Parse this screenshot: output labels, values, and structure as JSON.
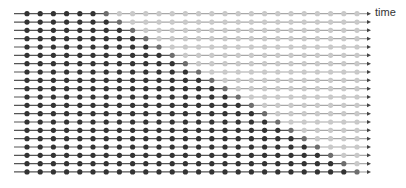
{
  "diagram": {
    "type": "timeline-staircase",
    "axis_label": "time",
    "rows": 20,
    "columns": 26,
    "layout": {
      "line_start_x": 14,
      "line_end_x": 371,
      "first_dot_x": 27,
      "dot_spacing_x": 13.2,
      "first_row_y": 13.7,
      "row_spacing_y": 8.33,
      "dot_radius": 2.6
    },
    "rule": "row r: columns 0..r+5 filled dark, column r+6 transition, remaining columns light",
    "row_states": [
      {
        "row": 0,
        "dark_through": 5,
        "transition_col": 6
      },
      {
        "row": 1,
        "dark_through": 6,
        "transition_col": 7
      },
      {
        "row": 2,
        "dark_through": 7,
        "transition_col": 8
      },
      {
        "row": 3,
        "dark_through": 8,
        "transition_col": 9
      },
      {
        "row": 4,
        "dark_through": 9,
        "transition_col": 10
      },
      {
        "row": 5,
        "dark_through": 10,
        "transition_col": 11
      },
      {
        "row": 6,
        "dark_through": 11,
        "transition_col": 12
      },
      {
        "row": 7,
        "dark_through": 12,
        "transition_col": 13
      },
      {
        "row": 8,
        "dark_through": 13,
        "transition_col": 14
      },
      {
        "row": 9,
        "dark_through": 14,
        "transition_col": 15
      },
      {
        "row": 10,
        "dark_through": 15,
        "transition_col": 16
      },
      {
        "row": 11,
        "dark_through": 16,
        "transition_col": 17
      },
      {
        "row": 12,
        "dark_through": 17,
        "transition_col": 18
      },
      {
        "row": 13,
        "dark_through": 18,
        "transition_col": 19
      },
      {
        "row": 14,
        "dark_through": 19,
        "transition_col": 20
      },
      {
        "row": 15,
        "dark_through": 20,
        "transition_col": 21
      },
      {
        "row": 16,
        "dark_through": 21,
        "transition_col": 22
      },
      {
        "row": 17,
        "dark_through": 22,
        "transition_col": 23
      },
      {
        "row": 18,
        "dark_through": 23,
        "transition_col": 24
      },
      {
        "row": 19,
        "dark_through": 24,
        "transition_col": 25
      }
    ],
    "colors": {
      "dark_dot": "#333333",
      "transition_dot": "#6e6e6e",
      "light_dot": "#c9c9c9",
      "line_dark": "#555555",
      "line_light": "#a8a8a8",
      "arrow": "#444444",
      "label": "#333333"
    }
  }
}
